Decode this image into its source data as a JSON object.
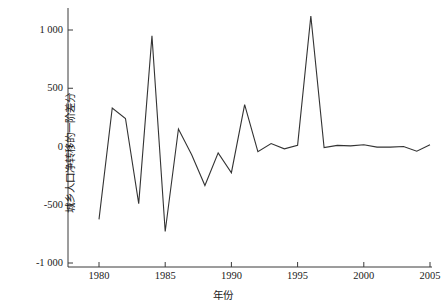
{
  "chart_data": {
    "type": "line",
    "title": "",
    "xlabel": "年份",
    "ylabel": "城乡人口净转移的一阶差分",
    "xlim": [
      1979.3,
      2005.6
    ],
    "ylim": [
      -1000,
      1150
    ],
    "grid": false,
    "legend_position": "none",
    "line_color": "#333333",
    "xticks": [
      1980,
      1985,
      1990,
      1995,
      2000,
      2005
    ],
    "xtick_labels": [
      "1980",
      "1985",
      "1990",
      "1995",
      "2000",
      "2005"
    ],
    "yticks": [
      -1000,
      -500,
      0,
      500,
      1000
    ],
    "ytick_labels": [
      "-1 000",
      "-500",
      "0",
      "500",
      "1 000"
    ],
    "x": [
      1980,
      1981,
      1982,
      1983,
      1984,
      1985,
      1986,
      1987,
      1988,
      1989,
      1990,
      1991,
      1992,
      1993,
      1994,
      1995,
      1996,
      1997,
      1998,
      1999,
      2000,
      2001,
      2002,
      2003,
      2004,
      2005
    ],
    "values": [
      -625,
      330,
      240,
      -490,
      950,
      -730,
      150,
      -70,
      -335,
      -55,
      -225,
      360,
      -45,
      25,
      -20,
      10,
      1120,
      -10,
      10,
      5,
      15,
      -5,
      -5,
      0,
      -40,
      15
    ],
    "series": [
      {
        "name": "城乡人口净转移的一阶差分",
        "values": [
          -625,
          330,
          240,
          -490,
          950,
          -730,
          150,
          -70,
          -335,
          -55,
          -225,
          360,
          -45,
          25,
          -20,
          10,
          1120,
          -10,
          10,
          5,
          15,
          -5,
          -5,
          0,
          -40,
          15
        ]
      }
    ]
  }
}
